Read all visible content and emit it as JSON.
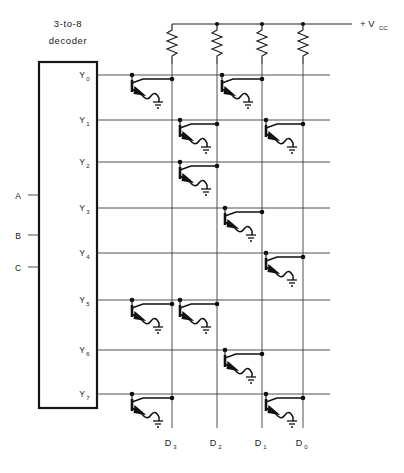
{
  "figure": {
    "kind": "schematic",
    "decoder": {
      "label_line1": "3-to-8",
      "label_line2": "decoder",
      "inputs": [
        {
          "name": "A",
          "label": "A",
          "y": 195
        },
        {
          "name": "B",
          "label": "B",
          "y": 235
        },
        {
          "name": "C",
          "label": "C",
          "y": 267
        }
      ],
      "outputs": [
        {
          "name": "Y0",
          "base": "Y",
          "sub": "0",
          "y": 75
        },
        {
          "name": "Y1",
          "base": "Y",
          "sub": "1",
          "y": 120
        },
        {
          "name": "Y2",
          "base": "Y",
          "sub": "2",
          "y": 162
        },
        {
          "name": "Y3",
          "base": "Y",
          "sub": "3",
          "y": 208
        },
        {
          "name": "Y4",
          "base": "Y",
          "sub": "4",
          "y": 253
        },
        {
          "name": "Y5",
          "base": "Y",
          "sub": "5",
          "y": 300
        },
        {
          "name": "Y6",
          "base": "Y",
          "sub": "6",
          "y": 350
        },
        {
          "name": "Y7",
          "base": "Y",
          "sub": "7",
          "y": 394
        }
      ]
    },
    "supply": {
      "label": "+ V",
      "sub": "CC",
      "rail_y": 24
    },
    "data_lines": [
      {
        "name": "D3",
        "base": "D",
        "sub": "3",
        "x": 172
      },
      {
        "name": "D2",
        "base": "D",
        "sub": "2",
        "x": 217
      },
      {
        "name": "D1",
        "base": "D",
        "sub": "1",
        "x": 262
      },
      {
        "name": "D0",
        "base": "D",
        "sub": "0",
        "x": 303
      }
    ],
    "pullup_resistors": [
      {
        "on": "D3",
        "x": 172
      },
      {
        "on": "D2",
        "x": 217
      },
      {
        "on": "D1",
        "x": 262
      },
      {
        "on": "D0",
        "x": 303
      }
    ],
    "transistor_matrix": [
      {
        "row": "Y0",
        "columns": [
          "D3",
          "D1"
        ]
      },
      {
        "row": "Y1",
        "columns": [
          "D2",
          "D0"
        ]
      },
      {
        "row": "Y2",
        "columns": [
          "D2"
        ]
      },
      {
        "row": "Y3",
        "columns": [
          "D1"
        ]
      },
      {
        "row": "Y4",
        "columns": [
          "D0"
        ]
      },
      {
        "row": "Y5",
        "columns": [
          "D3",
          "D2"
        ]
      },
      {
        "row": "Y6",
        "columns": [
          "D1"
        ]
      },
      {
        "row": "Y7",
        "columns": [
          "D3",
          "D0"
        ]
      }
    ]
  }
}
